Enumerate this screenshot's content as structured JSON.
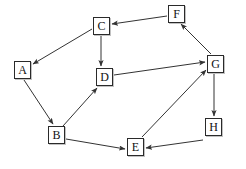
{
  "diagram": {
    "type": "directed-graph",
    "width": 246,
    "height": 169,
    "background_color": "#ffffff",
    "node_border_color": "#2a2a2a",
    "node_fill_color": "#ffffff",
    "edge_color": "#333333",
    "nodes": [
      {
        "id": "A",
        "label": "A",
        "x": 14,
        "y": 61
      },
      {
        "id": "B",
        "label": "B",
        "x": 48,
        "y": 126
      },
      {
        "id": "C",
        "label": "C",
        "x": 93,
        "y": 17
      },
      {
        "id": "D",
        "label": "D",
        "x": 96,
        "y": 68
      },
      {
        "id": "E",
        "label": "E",
        "x": 127,
        "y": 138
      },
      {
        "id": "F",
        "label": "F",
        "x": 168,
        "y": 5
      },
      {
        "id": "G",
        "label": "G",
        "x": 207,
        "y": 55
      },
      {
        "id": "H",
        "label": "H",
        "x": 205,
        "y": 118
      }
    ],
    "edges": [
      {
        "from": "F",
        "to": "C",
        "x1": 167,
        "y1": 16,
        "x2": 112,
        "y2": 24
      },
      {
        "from": "C",
        "to": "A",
        "x1": 92,
        "y1": 29,
        "x2": 33,
        "y2": 64
      },
      {
        "from": "C",
        "to": "D",
        "x1": 101,
        "y1": 36,
        "x2": 101,
        "y2": 66
      },
      {
        "from": "A",
        "to": "B",
        "x1": 24,
        "y1": 80,
        "x2": 53,
        "y2": 124
      },
      {
        "from": "B",
        "to": "D",
        "x1": 63,
        "y1": 126,
        "x2": 97,
        "y2": 88
      },
      {
        "from": "D",
        "to": "G",
        "x1": 114,
        "y1": 75,
        "x2": 205,
        "y2": 62
      },
      {
        "from": "B",
        "to": "E",
        "x1": 66,
        "y1": 139,
        "x2": 125,
        "y2": 149
      },
      {
        "from": "H",
        "to": "E",
        "x1": 203,
        "y1": 140,
        "x2": 146,
        "y2": 148
      },
      {
        "from": "E",
        "to": "G",
        "x1": 142,
        "y1": 137,
        "x2": 206,
        "y2": 70
      },
      {
        "from": "G",
        "to": "F",
        "x1": 211,
        "y1": 54,
        "x2": 181,
        "y2": 24
      },
      {
        "from": "G",
        "to": "H",
        "x1": 214,
        "y1": 74,
        "x2": 214,
        "y2": 116
      }
    ]
  }
}
